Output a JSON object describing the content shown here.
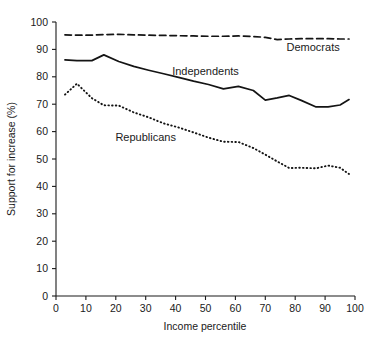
{
  "chart_data": {
    "type": "line",
    "title": "",
    "xlabel": "Income percentile",
    "ylabel": "Support for increase (%)",
    "xlim": [
      0,
      100
    ],
    "ylim": [
      0,
      100
    ],
    "grid": false,
    "legend_position": "inline-annotations",
    "xticks": [
      "0",
      "10",
      "20",
      "30",
      "40",
      "50",
      "60",
      "70",
      "80",
      "90",
      "100"
    ],
    "xtick_values": [
      0,
      10,
      20,
      30,
      40,
      50,
      60,
      70,
      80,
      90,
      100
    ],
    "yticks": [
      "0",
      "10",
      "20",
      "30",
      "40",
      "50",
      "60",
      "70",
      "80",
      "90",
      "100"
    ],
    "ytick_values": [
      0,
      10,
      20,
      30,
      40,
      50,
      60,
      70,
      80,
      90,
      100
    ],
    "series": [
      {
        "name": "Democrats",
        "style": "dashed",
        "color": "#141414",
        "x": [
          3,
          7,
          12,
          16,
          21,
          26,
          31,
          36,
          41,
          46,
          51,
          56,
          61,
          66,
          70,
          74,
          78,
          82,
          87,
          91,
          95,
          98
        ],
        "values": [
          95.3,
          95.2,
          95.2,
          95.4,
          95.5,
          95.3,
          95.2,
          95.1,
          95.0,
          94.9,
          94.8,
          94.8,
          94.9,
          94.7,
          94.4,
          93.6,
          93.8,
          93.9,
          93.9,
          93.9,
          93.8,
          93.8
        ]
      },
      {
        "name": "Independents",
        "style": "solid",
        "color": "#141414",
        "x": [
          3,
          7,
          12,
          16,
          21,
          26,
          31,
          36,
          41,
          46,
          51,
          56,
          61,
          66,
          70,
          74,
          78,
          82,
          87,
          91,
          95,
          98
        ],
        "values": [
          86.2,
          85.9,
          85.9,
          88.0,
          85.6,
          83.8,
          82.4,
          81.1,
          79.8,
          78.4,
          77.2,
          75.6,
          76.5,
          75.0,
          71.5,
          72.3,
          73.2,
          71.4,
          69.0,
          69.0,
          69.7,
          71.7
        ]
      },
      {
        "name": "Republicans",
        "style": "dotted",
        "color": "#141414",
        "x": [
          3,
          7,
          12,
          16,
          21,
          26,
          31,
          36,
          41,
          46,
          51,
          56,
          61,
          66,
          70,
          74,
          78,
          82,
          87,
          91,
          95,
          98
        ],
        "values": [
          73.5,
          77.5,
          72.2,
          69.6,
          69.5,
          67.0,
          65.2,
          63.0,
          61.5,
          59.7,
          57.8,
          56.3,
          56.2,
          54.0,
          51.6,
          49.1,
          46.7,
          46.8,
          46.6,
          47.6,
          46.8,
          44.5
        ]
      }
    ],
    "annotations": [
      {
        "text": "Democrats",
        "x": 86,
        "y": 89.5
      },
      {
        "text": "Independents",
        "x": 50,
        "y": 80.5
      },
      {
        "text": "Republicans",
        "x": 30,
        "y": 56.5
      }
    ]
  },
  "axes": {
    "x_title": "Income percentile",
    "y_title": "Support for increase (%)"
  }
}
